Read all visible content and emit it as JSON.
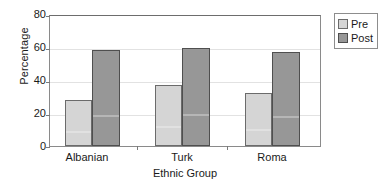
{
  "chart_data": {
    "type": "bar",
    "title": "",
    "subtitle": "",
    "xlabel": "Ethnic Group",
    "ylabel": "Percentage",
    "categories": [
      "Albanian",
      "Turk",
      "Roma"
    ],
    "series": [
      {
        "name": "Pre",
        "values": [
          28,
          37,
          32
        ],
        "color": "#d5d5d5"
      },
      {
        "name": "Post",
        "values": [
          58,
          59.5,
          57
        ],
        "color": "#979797"
      }
    ],
    "ylim": [
      0,
      80
    ],
    "yticks": [
      0,
      20,
      40,
      60,
      80
    ],
    "ytick_labels": [
      "0",
      "20",
      "40",
      "60",
      "80"
    ],
    "grid": true,
    "grid_axis": "y",
    "legend_position": "outside-top-right",
    "legend_entries": [
      "Pre",
      "Post"
    ],
    "annotations": []
  },
  "legend": {
    "items": [
      {
        "label": "Pre",
        "swatch": "legend-swatch-pre"
      },
      {
        "label": "Post",
        "swatch": "legend-swatch-post"
      }
    ]
  },
  "axes": {
    "y_title": "Percentage",
    "x_title": "Ethnic Group",
    "y_tick_0": "0",
    "y_tick_1": "20",
    "y_tick_2": "40",
    "y_tick_3": "60",
    "y_tick_4": "80",
    "x_tick_0": "Albanian",
    "x_tick_1": "Turk",
    "x_tick_2": "Roma"
  }
}
